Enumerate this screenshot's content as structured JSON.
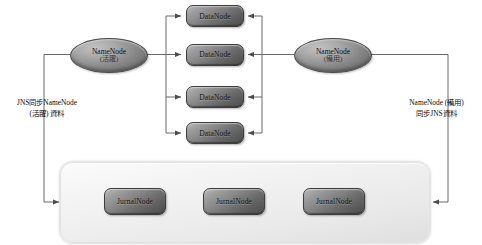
{
  "diagram": {
    "namenodes": [
      {
        "id": "namenode-active",
        "name": "NameNode",
        "state": "(活躍)"
      },
      {
        "id": "namenode-standby",
        "name": "NameNode",
        "state": "(備用)"
      }
    ],
    "datanodes": [
      {
        "label": "DataNode"
      },
      {
        "label": "DataNode"
      },
      {
        "label": "DataNode"
      },
      {
        "label": "DataNode"
      }
    ],
    "journalnodes": [
      {
        "label": "JurnalNode"
      },
      {
        "label": "JurnalNode"
      },
      {
        "label": "JurnalNode"
      }
    ],
    "captions": {
      "left": {
        "line1": "JNS同步NameNode",
        "line2": "(活躍) 資料"
      },
      "right": {
        "line1": "NameNode (備用)",
        "line2": "同步JNS資料"
      }
    },
    "colors": {
      "node_fill_light": "#b9b9b9",
      "node_fill_dark": "#4e4e4e",
      "node_border": "#3e3e3e",
      "container_fill": "#f2f2f2",
      "wire": "#595959",
      "text": "#101010",
      "background": "#ffffff"
    }
  }
}
